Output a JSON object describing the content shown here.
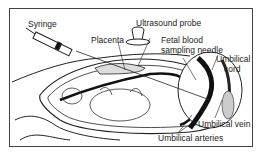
{
  "diagram": {
    "labels": {
      "syringe": "Syringe",
      "ultrasound_probe": "Ultrasound probe",
      "placenta": "Placenta",
      "fetal_needle_line1": "Fetal blood",
      "fetal_needle_line2": "sampling needle",
      "cord_line1": "Umbilical",
      "cord_line2": "cord",
      "vein": "Umbilical vein",
      "arteries": "Umbilical arteries"
    }
  }
}
